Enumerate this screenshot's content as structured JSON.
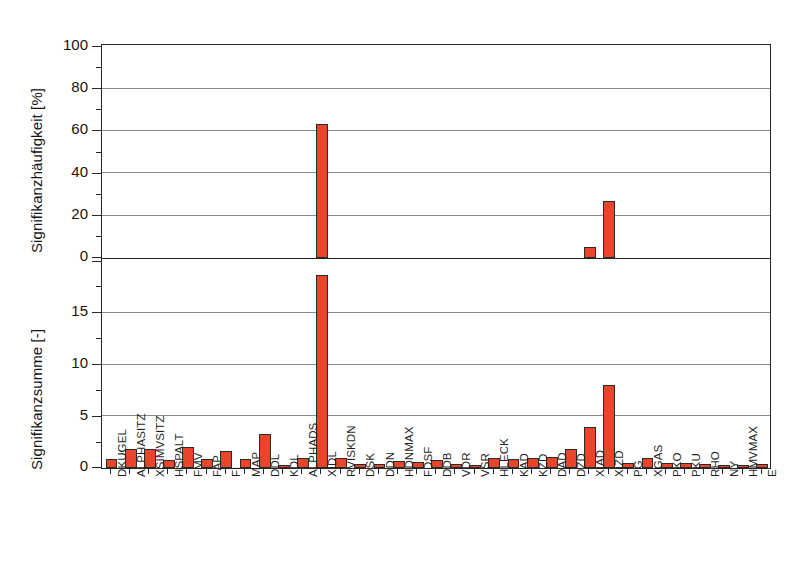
{
  "chart_data": {
    "type": "bar",
    "title": "",
    "subtitle": "",
    "grid": true,
    "legend": "none",
    "orientation": "vertical",
    "panels": [
      {
        "id": "top",
        "ylabel": "Signifikanzhäufigkeit [%]",
        "ylim": [
          0,
          100
        ],
        "yticks": [
          0,
          20,
          40,
          60,
          80,
          100
        ],
        "yticklabels": [
          "0",
          "20",
          "40",
          "60",
          "80",
          "100"
        ],
        "yminorticks": [
          10,
          30,
          50,
          70,
          90
        ],
        "values": [
          0,
          0,
          0,
          0,
          0,
          0,
          0,
          0,
          0,
          0,
          0,
          63.5,
          0,
          0,
          0,
          0,
          0,
          0,
          0,
          0,
          0,
          0,
          0,
          0,
          0,
          5.0,
          27.0,
          0,
          0,
          0,
          0,
          0,
          0,
          0,
          0
        ]
      },
      {
        "id": "bottom",
        "ylabel": "Signifikanzsumme [-]",
        "ylim": [
          0,
          20
        ],
        "yticks": [
          0,
          5,
          10,
          15,
          20
        ],
        "yticklabels": [
          "0",
          "5",
          "10",
          "15",
          ""
        ],
        "yminorticks": [
          2.5,
          7.5,
          12.5,
          17.5
        ],
        "values": [
          0.9,
          1.8,
          1.8,
          0.8,
          2.0,
          0.85,
          1.6,
          0.9,
          3.3,
          0.3,
          1.0,
          18.7,
          0.95,
          0.4,
          0.4,
          0.7,
          0.55,
          0.75,
          0.35,
          0.3,
          0.95,
          0.9,
          1.0,
          1.1,
          1.8,
          4.0,
          8.0,
          0.5,
          0.95,
          0.45,
          0.45,
          0.4,
          0.25,
          0.3,
          0.35
        ]
      }
    ],
    "categories": [
      "DKUGEL",
      "ALPHASITZ",
      "XSIMVSITZ",
      "HSPALT",
      "FMV",
      "FAP",
      "FI",
      "MAP",
      "DDL",
      "KDL",
      "ALPHADS",
      "XIDL",
      "RVISKDN",
      "DSK",
      "DDN",
      "HDNMAX",
      "FDSF",
      "DDB",
      "VDR",
      "VSR",
      "HLECK",
      "KAD",
      "KZD",
      "DAD",
      "DZD",
      "XIAD",
      "XIZD",
      "PG",
      "XGAS",
      "PKO",
      "PKU",
      "RHO",
      "NY",
      "HMVMAX",
      "E"
    ],
    "xlabel": "",
    "colors": {
      "bar_fill": "#E8452A",
      "bar_edge": "#2a2a2a",
      "grid": "#8a8a8a",
      "axis": "#262626",
      "text": "#141414",
      "background": "#ffffff"
    }
  }
}
